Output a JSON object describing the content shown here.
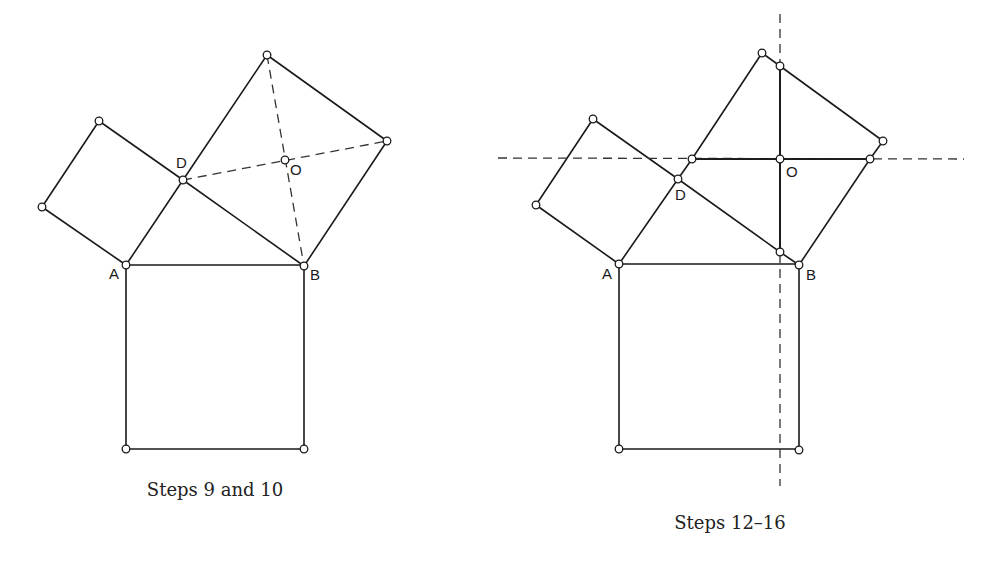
{
  "figures": [
    {
      "id": "left",
      "caption": "Steps 9 and 10",
      "labels": {
        "A": "A",
        "B": "B",
        "D": "D",
        "O": "O"
      }
    },
    {
      "id": "right",
      "caption": "Steps 12–16",
      "labels": {
        "A": "A",
        "B": "B",
        "D": "D",
        "O": "O"
      }
    }
  ],
  "colors": {
    "small_square_fill": "#999999",
    "light_piece_fill": "#c6c6c6",
    "dark_piece_fill": "#8c8c8c",
    "stroke": "#1a1a1a"
  }
}
